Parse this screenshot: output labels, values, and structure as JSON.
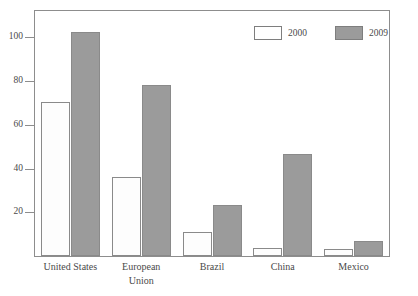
{
  "chart_data": {
    "type": "bar",
    "title": "",
    "subtitle": "",
    "xlabel": "",
    "ylabel": "",
    "ylim": [
      0,
      112
    ],
    "yticks": [
      20,
      40,
      60,
      80,
      100
    ],
    "ytick_labels": [
      "20",
      "40",
      "60",
      "80",
      "100"
    ],
    "grid": false,
    "legend_position": "top-right",
    "categories": [
      "United States",
      "European\nUnion",
      "Brazil",
      "China",
      "Mexico"
    ],
    "series": [
      {
        "name": "2000",
        "color": "#ffffff",
        "values": [
          70.5,
          36,
          11,
          3.5,
          3
        ]
      },
      {
        "name": "2009",
        "color": "#9b9b9b",
        "values": [
          102.5,
          78,
          23.5,
          46.5,
          7
        ]
      }
    ]
  },
  "legend": {
    "items": [
      {
        "label": "2000",
        "swatch": "white-swatch"
      },
      {
        "label": "2009",
        "swatch": "gray-swatch"
      }
    ]
  },
  "axes": {
    "y_tick_labels": [
      "100",
      "80",
      "60",
      "40",
      "20"
    ],
    "x_tick_labels": [
      "United States",
      "European\nUnion",
      "Brazil",
      "China",
      "Mexico"
    ]
  },
  "colors": {
    "series_2000": "#ffffff",
    "series_2009": "#9b9b9b",
    "frame": "#8d8d8d",
    "text": "#4a4a4a",
    "background": "#ffffff"
  }
}
